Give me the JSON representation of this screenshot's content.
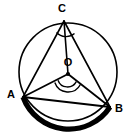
{
  "figure": {
    "type": "geometry-diagram",
    "background_color": "#ffffff",
    "stroke_color": "#000000",
    "canvas": {
      "width": 130,
      "height": 133
    }
  },
  "circle": {
    "name": "main-circle",
    "center_x": 68,
    "center_y": 72,
    "radius": 49,
    "stroke_width": 1.6,
    "stroke_color": "#000000",
    "fill": "none"
  },
  "points": [
    {
      "id": "C",
      "label": "C",
      "x": 64,
      "y": 21,
      "label_x": 62,
      "label_y": 12,
      "on_circle": true,
      "dot": false
    },
    {
      "id": "O",
      "label": "O",
      "x": 68,
      "y": 74,
      "label_x": 68,
      "label_y": 66,
      "on_circle": false,
      "dot": true,
      "dot_radius": 2.1
    },
    {
      "id": "A",
      "label": "A",
      "x": 23,
      "y": 97,
      "label_x": 11,
      "label_y": 98,
      "on_circle": true,
      "dot": false
    },
    {
      "id": "B",
      "label": "B",
      "x": 110,
      "y": 107,
      "label_x": 119,
      "label_y": 112,
      "on_circle": true,
      "dot": false
    }
  ],
  "segments": [
    {
      "name": "chord-CA",
      "from": "C",
      "to": "A",
      "stroke_width": 1.6
    },
    {
      "name": "chord-CB",
      "from": "C",
      "to": "B",
      "stroke_width": 1.6
    },
    {
      "name": "chord-AB",
      "from": "A",
      "to": "B",
      "stroke_width": 2.2
    },
    {
      "name": "radius-OA",
      "from": "O",
      "to": "A",
      "stroke_width": 1.8
    },
    {
      "name": "radius-OB",
      "from": "O",
      "to": "B",
      "stroke_width": 1.8
    },
    {
      "name": "radius-OC",
      "from": "O",
      "to": "C",
      "stroke_width": 1.6
    }
  ],
  "highlighted_arc": {
    "name": "bold-minor-arc-AB",
    "from": "A",
    "to": "B",
    "description": "minor arc AB drawn in bold black",
    "stroke_width": 5.2,
    "stroke_color": "#000000",
    "path": "M 23 97 A 49 49 0 0 0 110 107"
  },
  "angle_marks": [
    {
      "name": "inscribed-angle-ACB",
      "at": "C",
      "arc_count": 1,
      "radius": 13,
      "stroke_width": 1.4,
      "path": "M 56.5 32.5 A 13 13 0 0 0 74.5 33.5"
    },
    {
      "name": "central-angle-AOB-outer",
      "at": "O",
      "arc_count": 2,
      "radius": 14,
      "stroke_width": 1.4,
      "path": "M 54.8 82.6 A 14 14 0 0 0 80.4 84.5"
    },
    {
      "name": "central-angle-AOB-inner",
      "at": "O",
      "arc_count": 2,
      "radius": 10,
      "stroke_width": 1.4,
      "path": "M 58.0 80.2 A 10 10 0 0 0 76.3 81.6"
    }
  ]
}
